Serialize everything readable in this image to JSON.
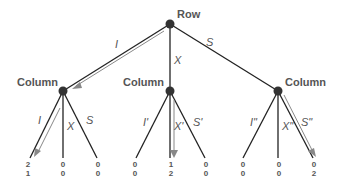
{
  "diagram": {
    "type": "game-tree",
    "root": {
      "label": "Row",
      "x": 170,
      "y": 24
    },
    "colors": {
      "line": "#222222",
      "node": "#333333",
      "arrow": "#888888",
      "text": "#555555"
    },
    "branches": [
      {
        "label": "I",
        "to": "col1"
      },
      {
        "label": "X",
        "to": "col2"
      },
      {
        "label": "S",
        "to": "col3"
      }
    ],
    "nodes": [
      {
        "id": "col1",
        "label": "Column",
        "x": 63,
        "y": 91,
        "actions": [
          {
            "label": "I",
            "payoff_row": "2",
            "payoff_col": "1",
            "x": 30
          },
          {
            "label": "X",
            "payoff_row": "0",
            "payoff_col": "0",
            "x": 63
          },
          {
            "label": "S",
            "payoff_row": "0",
            "payoff_col": "0",
            "x": 97
          }
        ]
      },
      {
        "id": "col2",
        "label": "Column",
        "x": 170,
        "y": 91,
        "actions": [
          {
            "label": "I'",
            "payoff_row": "0",
            "payoff_col": "0",
            "x": 136
          },
          {
            "label": "X'",
            "payoff_row": "1",
            "payoff_col": "2",
            "x": 170
          },
          {
            "label": "S'",
            "payoff_row": "0",
            "payoff_col": "0",
            "x": 205
          }
        ]
      },
      {
        "id": "col3",
        "label": "Column",
        "x": 278,
        "y": 91,
        "actions": [
          {
            "label": "I\"",
            "payoff_row": "0",
            "payoff_col": "0",
            "x": 243
          },
          {
            "label": "X\"",
            "payoff_row": "0",
            "payoff_col": "0",
            "x": 278
          },
          {
            "label": "S\"",
            "payoff_row": "0",
            "payoff_col": "2",
            "x": 313
          }
        ]
      }
    ]
  }
}
